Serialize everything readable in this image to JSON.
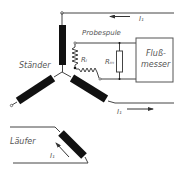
{
  "diagram": {
    "type": "electrical-schematic",
    "labels": {
      "staender": "Ständer",
      "probespule": "Probespule",
      "r_i": "Rᵢ",
      "r_m": "Rₘ",
      "flussmesser_line1": "Fluß-",
      "flussmesser_line2": "messer",
      "current_top": "I₁",
      "current_right": "I₁",
      "laeufer": "Läufer",
      "current_rotor": "I₁"
    },
    "components": [
      {
        "id": "stator-winding-top",
        "kind": "coil"
      },
      {
        "id": "stator-winding-left",
        "kind": "coil"
      },
      {
        "id": "stator-winding-right",
        "kind": "coil"
      },
      {
        "id": "probe-coil",
        "kind": "zigzag-resistor",
        "label": "Rᵢ"
      },
      {
        "id": "measuring-resistor",
        "kind": "resistor",
        "label": "Rₘ"
      },
      {
        "id": "flux-meter",
        "kind": "box",
        "label": "Flußmesser"
      },
      {
        "id": "rotor-winding",
        "kind": "coil"
      }
    ],
    "colors": {
      "ink": "#111111",
      "wire": "#444444",
      "text": "#555555",
      "background": "#ffffff"
    }
  }
}
